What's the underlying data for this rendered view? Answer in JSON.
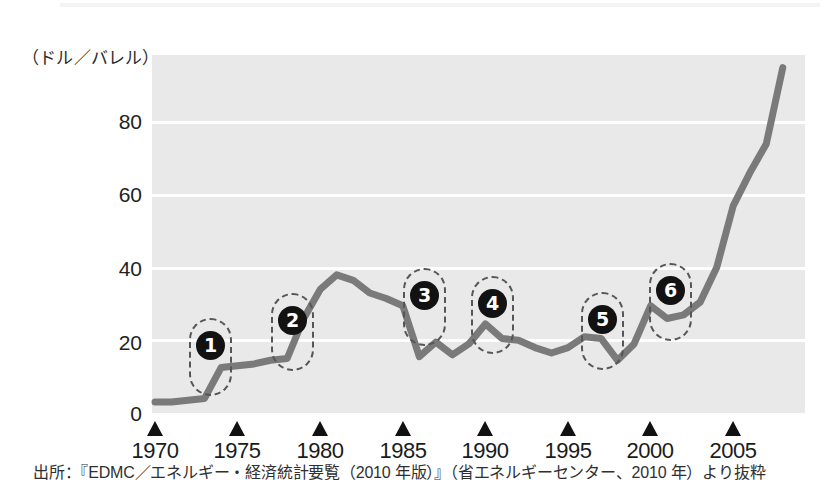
{
  "figure": {
    "y_axis_unit_label": "（ドル／バレル）",
    "source_note": "出所：『EDMC／エネルギー・経済統計要覧（2010 年版）』（省エネルギーセンター、2010 年）より抜粋"
  },
  "chart_data": {
    "type": "line",
    "title": "",
    "subtitle": "",
    "xlabel": "",
    "ylabel": "（ドル／バレル）",
    "ylim": [
      0,
      98
    ],
    "xlim": [
      1970,
      2008
    ],
    "grid": "horizontal-white-gridlines",
    "legend": "none",
    "y_ticks": [
      0,
      20,
      40,
      60,
      80
    ],
    "y_tick_labels": [
      "0",
      "20",
      "40",
      "60",
      "80"
    ],
    "x_ticks": [
      1970,
      1975,
      1980,
      1985,
      1990,
      1995,
      2000,
      2005
    ],
    "x_tick_labels": [
      "1970",
      "1975",
      "1980",
      "1985",
      "1990",
      "1995",
      "2000",
      "2005"
    ],
    "series": [
      {
        "name": "原油価格",
        "color": "#7a7a7a",
        "x": [
          1970,
          1971,
          1972,
          1973,
          1974,
          1975,
          1976,
          1977,
          1978,
          1979,
          1980,
          1981,
          1982,
          1983,
          1984,
          1985,
          1986,
          1987,
          1988,
          1989,
          1990,
          1991,
          1992,
          1993,
          1994,
          1995,
          1996,
          1997,
          1998,
          1999,
          2000,
          2001,
          2002,
          2003,
          2004,
          2005,
          2006,
          2007,
          2008
        ],
        "values": [
          3,
          3,
          3.5,
          4,
          12.5,
          13,
          13.5,
          14.5,
          15,
          26,
          34,
          38,
          36.5,
          33,
          31.5,
          29.5,
          15.5,
          19.5,
          16,
          19,
          24.5,
          20.5,
          20,
          18,
          16.5,
          18,
          21,
          20.5,
          14.5,
          19,
          29.5,
          26,
          27,
          30.5,
          40,
          57,
          66,
          74,
          95
        ]
      }
    ],
    "annotations": [
      {
        "id": 1,
        "badge": "❶",
        "label": "1",
        "year_center": 1973.6,
        "note": "第一次石油危機"
      },
      {
        "id": 2,
        "badge": "❷",
        "label": "2",
        "year_center": 1979.0,
        "note": "第二次石油危機"
      },
      {
        "id": 3,
        "badge": "❸",
        "label": "3",
        "year_center": 1986.0,
        "note": "逆オイルショック"
      },
      {
        "id": 4,
        "badge": "❹",
        "label": "4",
        "year_center": 1990.3,
        "note": "湾岸危機"
      },
      {
        "id": 5,
        "badge": "❺",
        "label": "5",
        "year_center": 1996.6,
        "note": "アジア通貨危機前"
      },
      {
        "id": 6,
        "badge": "❻",
        "label": "6",
        "year_center": 2000.4,
        "note": "2000年価格上昇"
      }
    ]
  },
  "y_ticks": [
    {
      "label": "80",
      "top": 110
    },
    {
      "label": "60",
      "top": 183
    },
    {
      "label": "40",
      "top": 257
    },
    {
      "label": "20",
      "top": 331
    },
    {
      "label": "0",
      "top": 402
    }
  ],
  "x_ticks": [
    {
      "label": "1970",
      "x": 155
    },
    {
      "label": "1975",
      "x": 237
    },
    {
      "label": "1980",
      "x": 320
    },
    {
      "label": "1985",
      "x": 403
    },
    {
      "label": "1990",
      "x": 485
    },
    {
      "label": "1995",
      "x": 568
    },
    {
      "label": "2000",
      "x": 650
    },
    {
      "label": "2005",
      "x": 733
    }
  ],
  "callouts": [
    {
      "label": "1",
      "left": 189,
      "top": 318,
      "width": 43,
      "height": 78,
      "badge_left": 196,
      "badge_top": 331,
      "badge_size": 29
    },
    {
      "label": "2",
      "left": 271,
      "top": 293,
      "width": 43,
      "height": 78,
      "badge_left": 278,
      "badge_top": 306,
      "badge_size": 29
    },
    {
      "label": "3",
      "left": 403,
      "top": 268,
      "width": 43,
      "height": 78,
      "badge_left": 410,
      "badge_top": 281,
      "badge_size": 29
    },
    {
      "label": "4",
      "left": 471,
      "top": 276,
      "width": 43,
      "height": 78,
      "badge_left": 478,
      "badge_top": 289,
      "badge_size": 29
    },
    {
      "label": "5",
      "left": 581,
      "top": 292,
      "width": 43,
      "height": 78,
      "badge_left": 588,
      "badge_top": 305,
      "badge_size": 29
    },
    {
      "label": "6",
      "left": 649,
      "top": 263,
      "width": 43,
      "height": 78,
      "badge_left": 656,
      "badge_top": 276,
      "badge_size": 29
    }
  ]
}
